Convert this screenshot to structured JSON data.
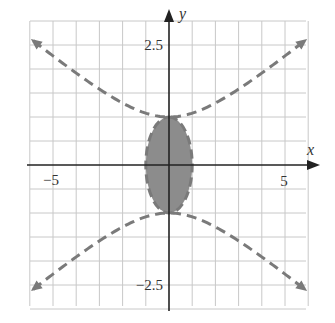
{
  "chart_data": {
    "type": "region",
    "title": "",
    "xlabel": "x",
    "ylabel": "y",
    "xlim": [
      -6,
      6
    ],
    "ylim": [
      -3,
      3
    ],
    "grid": true,
    "grid_step": {
      "x": 1,
      "y": 0.5
    },
    "tick_labels": {
      "x": [
        {
          "value": -5,
          "label": "−5"
        },
        {
          "value": 5,
          "label": "5"
        }
      ],
      "y": [
        {
          "value": 2.5,
          "label": "2.5"
        },
        {
          "value": -2.5,
          "label": "−2.5"
        }
      ]
    },
    "curves": [
      {
        "name": "hyperbola",
        "equation": "y^2 - x^2/6 = 1",
        "style": "dashed",
        "vertices": [
          [
            0,
            1
          ],
          [
            0,
            -1
          ]
        ],
        "arrows": true
      },
      {
        "name": "circle",
        "equation": "x^2 + y^2 = 1",
        "style": "dashed",
        "center": [
          0,
          0
        ],
        "radius": 1
      }
    ],
    "shaded_region": {
      "description": "interior of circle x^2 + y^2 < 1",
      "fill": "#8c8c8c"
    },
    "colors": {
      "curve": "#7a7a7a",
      "grid": "#c8c8c8",
      "axis": "#222222",
      "fill": "#8c8c8c"
    }
  }
}
